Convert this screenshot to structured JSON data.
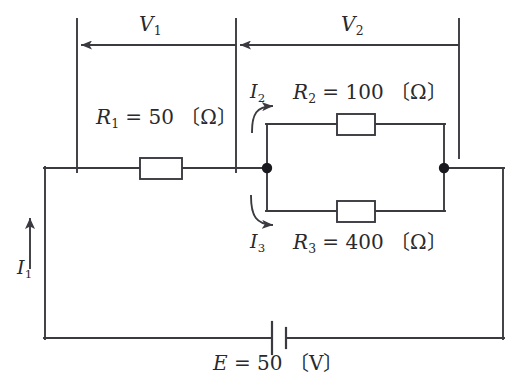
{
  "diagram": {
    "stroke_color": "#3a3a40",
    "text_color": "#29292e",
    "background_color": "#ffffff",
    "voltages": [
      {
        "id": "V1",
        "symbol": "V",
        "subscript": "1",
        "label": "V1",
        "span": "across R1"
      },
      {
        "id": "V2",
        "symbol": "V",
        "subscript": "2",
        "label": "V2",
        "span": "across parallel R2/R3"
      }
    ],
    "currents": [
      {
        "id": "I1",
        "symbol": "I",
        "subscript": "1",
        "label": "I1",
        "direction": "up",
        "arrow": "straight"
      },
      {
        "id": "I2",
        "symbol": "I",
        "subscript": "2",
        "label": "I2",
        "direction": "right",
        "arrow": "curved-up"
      },
      {
        "id": "I3",
        "symbol": "I",
        "subscript": "3",
        "label": "I3",
        "direction": "right",
        "arrow": "curved-down"
      }
    ],
    "resistors": [
      {
        "id": "R1",
        "symbol": "R",
        "subscript": "1",
        "equals": "=",
        "value": "50",
        "unit_open": "〔",
        "unit": "Ω",
        "unit_close": "〕",
        "label": "R1 = 50 〔Ω〕",
        "position": "series branch, left"
      },
      {
        "id": "R2",
        "symbol": "R",
        "subscript": "2",
        "equals": "=",
        "value": "100",
        "unit_open": "〔",
        "unit": "Ω",
        "unit_close": "〕",
        "label": "R2 = 100 〔Ω〕",
        "position": "parallel branch, upper"
      },
      {
        "id": "R3",
        "symbol": "R",
        "subscript": "3",
        "equals": "=",
        "value": "400",
        "unit_open": "〔",
        "unit": "Ω",
        "unit_close": "〕",
        "label": "R3 = 400 〔Ω〕",
        "position": "parallel branch, lower"
      }
    ],
    "source": {
      "id": "E",
      "symbol": "E",
      "subscript": "",
      "equals": "=",
      "value": "50",
      "unit_open": "〔",
      "unit": "V",
      "unit_close": "〕",
      "label": "E = 50 〔V〕",
      "type": "battery",
      "position": "bottom wire"
    }
  }
}
